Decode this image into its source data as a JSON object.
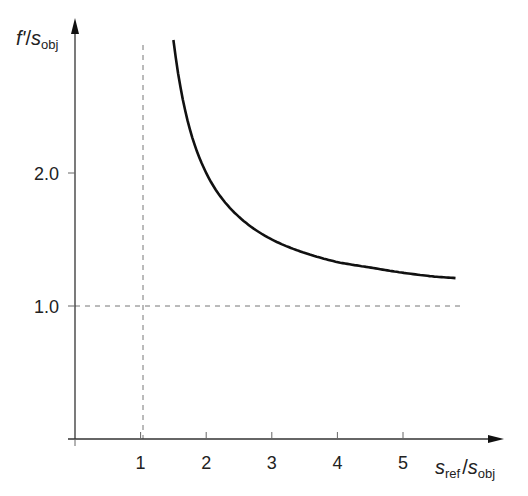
{
  "chart_data": {
    "type": "line",
    "title": "",
    "xlabel": "s_ref / s_obj",
    "ylabel": "f' / s_obj",
    "xlabel_parts": {
      "main": "s",
      "sub": "ref",
      "sep": "/",
      "main2": "s",
      "sub2": "obj"
    },
    "ylabel_parts": {
      "main": "f'",
      "sep": "/",
      "main2": "s",
      "sub2": "obj"
    },
    "x_ticks": [
      "1",
      "2",
      "3",
      "4",
      "5"
    ],
    "y_ticks": [
      "1.0",
      "2.0"
    ],
    "xlim": [
      0,
      6.2
    ],
    "ylim": [
      0,
      3.1
    ],
    "grid": false,
    "reference_lines": [
      {
        "orientation": "vertical",
        "value": 1,
        "style": "dashed"
      },
      {
        "orientation": "horizontal",
        "value": 1.0,
        "style": "dashed"
      }
    ],
    "series": [
      {
        "name": "f'/s_obj = x/(x-1)",
        "x": [
          1.5,
          1.75,
          2,
          2.5,
          3,
          3.5,
          4,
          4.5,
          5,
          5.5,
          5.8
        ],
        "values": [
          3.0,
          2.33,
          2.0,
          1.67,
          1.5,
          1.4,
          1.33,
          1.29,
          1.25,
          1.22,
          1.21
        ]
      }
    ],
    "legend": null
  }
}
